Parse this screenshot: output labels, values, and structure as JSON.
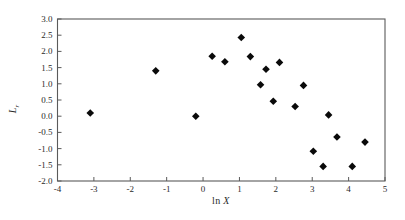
{
  "chart_data": {
    "type": "scatter",
    "title": "",
    "xlabel": "ln X",
    "ylabel": "L_r",
    "xlim": [
      -4,
      5
    ],
    "ylim": [
      -2.0,
      3.0
    ],
    "grid": false,
    "legend": "none",
    "marker": "filled-diamond",
    "x_ticks": [
      -4,
      -3,
      -2,
      -1,
      0,
      1,
      2,
      3,
      4,
      5
    ],
    "x_tick_labels": [
      "-4",
      "-3",
      "-2",
      "-1",
      "0",
      "1",
      "2",
      "3",
      "4",
      "5"
    ],
    "y_ticks": [
      3.0,
      2.5,
      2.0,
      1.5,
      1.0,
      0.5,
      0.0,
      -0.5,
      -1.0,
      -1.5,
      -2.0
    ],
    "y_tick_labels": [
      "3.0",
      "2.5",
      "2.0",
      "1.5",
      "1.0",
      "0.5",
      "0.0",
      "-0.5",
      "-1.0",
      "-1.5",
      "-2.0"
    ],
    "points": [
      [
        -3.1,
        0.1
      ],
      [
        -1.3,
        1.4
      ],
      [
        -0.2,
        0.0
      ],
      [
        0.25,
        1.85
      ],
      [
        0.6,
        1.68
      ],
      [
        1.05,
        2.43
      ],
      [
        1.3,
        1.84
      ],
      [
        1.73,
        1.45
      ],
      [
        2.1,
        1.66
      ],
      [
        1.58,
        0.97
      ],
      [
        2.76,
        0.95
      ],
      [
        1.93,
        0.46
      ],
      [
        2.53,
        0.3
      ],
      [
        3.45,
        0.04
      ],
      [
        3.68,
        -0.64
      ],
      [
        4.45,
        -0.8
      ],
      [
        3.03,
        -1.08
      ],
      [
        3.3,
        -1.55
      ],
      [
        4.1,
        -1.55
      ]
    ]
  },
  "labels": {
    "xlabel_prefix": "ln",
    "xlabel_var": "X",
    "ylabel_main": "L",
    "ylabel_sub": "r"
  },
  "colors": {
    "frame": "#5a5a5a",
    "marker": "#0a0a0a",
    "text": "#2a2a2a",
    "background": "#ffffff"
  }
}
